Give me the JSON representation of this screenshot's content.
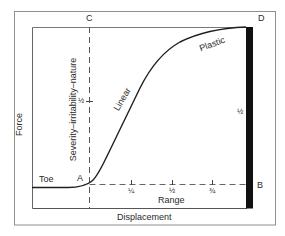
{
  "diagram": {
    "axes": {
      "y_label": "Force",
      "x_label": "Displacement",
      "range_label": "Range"
    },
    "points": {
      "A": "A",
      "B": "B",
      "C": "C",
      "D": "D"
    },
    "regions": {
      "toe": "Toe",
      "linear": "Linear",
      "plastic": "Plastic"
    },
    "vertical_annotation": "Severity–irritability–nature",
    "range_ticks": [
      "¼",
      "½",
      "¾"
    ],
    "half_marker_left": "½",
    "half_marker_right": "½",
    "colors": {
      "frame": "#8a8a8a",
      "ink": "#2a2a2a",
      "bar": "#111111",
      "background": "#ffffff"
    }
  }
}
